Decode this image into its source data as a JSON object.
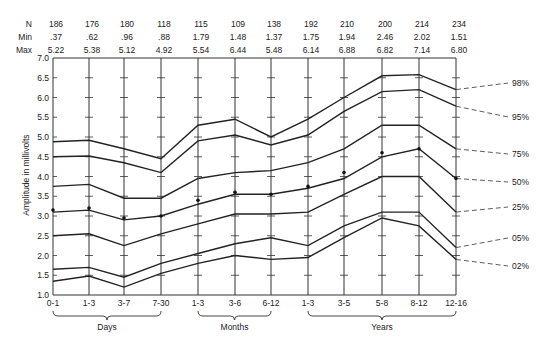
{
  "chart_data": {
    "type": "line",
    "title": "",
    "xlabel": "",
    "ylabel": "Amplitude in millivolts",
    "ylim": [
      1.0,
      7.0
    ],
    "yticks": [
      1.0,
      1.5,
      2.0,
      2.5,
      3.0,
      3.5,
      4.0,
      4.5,
      5.0,
      5.5,
      6.0,
      6.5,
      7.0
    ],
    "categories": [
      "0-1",
      "1-3",
      "3-7",
      "7-30",
      "1-3",
      "3-6",
      "6-12",
      "1-3",
      "3-5",
      "5-8",
      "8-12",
      "12-16"
    ],
    "groups": [
      {
        "label": "Days",
        "from": 0,
        "to": 3
      },
      {
        "label": "Months",
        "from": 4,
        "to": 6
      },
      {
        "label": "Years",
        "from": 7,
        "to": 11
      }
    ],
    "stats_table": {
      "N": [
        "186",
        "176",
        "180",
        "118",
        "115",
        "109",
        "138",
        "192",
        "210",
        "200",
        "214",
        "234"
      ],
      "Min": [
        ".37",
        ".62",
        ".96",
        ".88",
        "1.79",
        "1.48",
        "1.37",
        "1.75",
        "1.94",
        "2.46",
        "2.02",
        "1.51"
      ],
      "Max": [
        "5.22",
        "5.38",
        "5.12",
        "4.92",
        "5.54",
        "6.44",
        "5.48",
        "6.14",
        "6.88",
        "6.82",
        "7.14",
        "6.80"
      ]
    },
    "series": [
      {
        "name": "98%",
        "values": [
          4.88,
          4.92,
          4.7,
          4.45,
          5.3,
          5.45,
          5.0,
          5.45,
          6.0,
          6.55,
          6.58,
          6.2
        ]
      },
      {
        "name": "95%",
        "values": [
          4.5,
          4.52,
          4.35,
          4.1,
          4.9,
          5.05,
          4.8,
          5.05,
          5.65,
          6.15,
          6.2,
          5.78
        ]
      },
      {
        "name": "75%",
        "values": [
          3.75,
          3.8,
          3.45,
          3.45,
          3.95,
          4.1,
          4.15,
          4.35,
          4.7,
          5.3,
          5.3,
          4.7
        ]
      },
      {
        "name": "50%",
        "values": [
          3.1,
          3.15,
          2.9,
          3.0,
          3.3,
          3.55,
          3.55,
          3.7,
          3.95,
          4.5,
          4.7,
          3.95
        ]
      },
      {
        "name": "25%",
        "values": [
          2.5,
          2.55,
          2.25,
          2.55,
          2.8,
          3.05,
          3.05,
          3.1,
          3.55,
          4.0,
          4.0,
          3.1
        ]
      },
      {
        "name": "05%",
        "values": [
          1.65,
          1.7,
          1.45,
          1.8,
          2.05,
          2.3,
          2.45,
          2.25,
          2.75,
          3.1,
          3.1,
          2.2
        ]
      },
      {
        "name": "02%",
        "values": [
          1.35,
          1.48,
          1.2,
          1.55,
          1.8,
          2.0,
          1.9,
          1.95,
          2.45,
          2.95,
          2.75,
          1.9
        ]
      }
    ],
    "mean_points": [
      3.15,
      3.2,
      2.95,
      3.0,
      3.4,
      3.6,
      3.55,
      3.75,
      4.1,
      4.6,
      4.7,
      3.95
    ],
    "grid": false,
    "legend_position": "right (labels at line ends)"
  },
  "labels": {
    "n": "N",
    "min": "Min",
    "max": "Max",
    "y_axis": "Amplitude in millivolts"
  }
}
